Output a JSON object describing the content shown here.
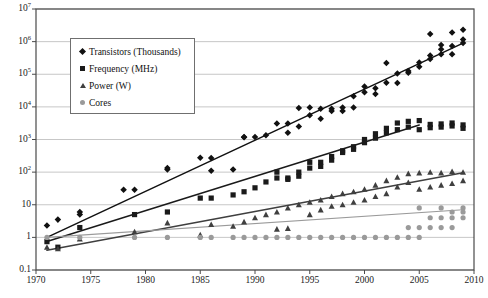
{
  "figure": {
    "caption_visible": "",
    "background": "#ffffff",
    "axis_color": "#4a4a4a",
    "grid_color": "#b9b9b9"
  },
  "legend": {
    "position": "upper-left-inside",
    "entries": [
      {
        "label": "Transistors (Thousands)",
        "marker": "diamond",
        "color": "#111111"
      },
      {
        "label": "Frequency (MHz)",
        "marker": "square",
        "color": "#1a1a1a"
      },
      {
        "label": "Power (W)",
        "marker": "triangle",
        "color": "#3f3f3f"
      },
      {
        "label": "Cores",
        "marker": "circle",
        "color": "#9a9a9a"
      }
    ]
  },
  "chart_data": {
    "type": "scatter",
    "title": "",
    "subtitle": "",
    "xlabel": "",
    "ylabel": "",
    "xlim": [
      1970,
      2010
    ],
    "ylim": [
      0.1,
      10000000
    ],
    "yscale": "log",
    "xscale": "linear",
    "grid": true,
    "xticks": [
      1970,
      1975,
      1980,
      1985,
      1990,
      1995,
      2000,
      2005,
      2010
    ],
    "xticklabels": [
      "1970",
      "1975",
      "1980",
      "1985",
      "1990",
      "1995",
      "2000",
      "2005",
      "2010"
    ],
    "yticks": [
      0.1,
      1,
      10,
      100,
      1000,
      10000,
      100000,
      1000000,
      10000000
    ],
    "yticklabels": [
      "0.1",
      "1",
      "10",
      "10^2",
      "10^3",
      "10^4",
      "10^5",
      "10^6",
      "10^7"
    ],
    "series": [
      {
        "name": "Transistors (Thousands)",
        "marker": "diamond",
        "color": "#111111",
        "trendline": {
          "from": [
            1971,
            1.0
          ],
          "to": [
            2009,
            900000
          ]
        },
        "points": [
          [
            1971,
            2.3
          ],
          [
            1972,
            3.5
          ],
          [
            1974,
            6.0
          ],
          [
            1974,
            5.0
          ],
          [
            1978,
            29
          ],
          [
            1979,
            29
          ],
          [
            1982,
            134
          ],
          [
            1982,
            120
          ],
          [
            1985,
            275
          ],
          [
            1986,
            273
          ],
          [
            1986,
            110
          ],
          [
            1988,
            120
          ],
          [
            1989,
            1180
          ],
          [
            1989,
            1200
          ],
          [
            1990,
            1200
          ],
          [
            1991,
            1350
          ],
          [
            1992,
            3100
          ],
          [
            1993,
            3100
          ],
          [
            1993,
            1600
          ],
          [
            1994,
            2500
          ],
          [
            1994,
            9300
          ],
          [
            1995,
            5500
          ],
          [
            1995,
            9500
          ],
          [
            1996,
            4300
          ],
          [
            1996,
            8800
          ],
          [
            1997,
            7500
          ],
          [
            1997,
            8800
          ],
          [
            1998,
            7500
          ],
          [
            1998,
            9500
          ],
          [
            1999,
            9500
          ],
          [
            1999,
            21000
          ],
          [
            2000,
            28000
          ],
          [
            2000,
            42000
          ],
          [
            2001,
            37000
          ],
          [
            2001,
            25000
          ],
          [
            2002,
            55000
          ],
          [
            2002,
            220000
          ],
          [
            2003,
            54000
          ],
          [
            2003,
            105000
          ],
          [
            2004,
            125000
          ],
          [
            2004,
            112000
          ],
          [
            2005,
            228000
          ],
          [
            2005,
            169000
          ],
          [
            2006,
            291000
          ],
          [
            2006,
            376000
          ],
          [
            2006,
            1700000
          ],
          [
            2007,
            582000
          ],
          [
            2007,
            789000
          ],
          [
            2007,
            410000
          ],
          [
            2008,
            731000
          ],
          [
            2008,
            410000
          ],
          [
            2008,
            1900000
          ],
          [
            2009,
            904000
          ],
          [
            2009,
            2300000
          ],
          [
            2009,
            1170000
          ]
        ]
      },
      {
        "name": "Frequency (MHz)",
        "marker": "square",
        "color": "#1a1a1a",
        "trendline": {
          "from": [
            1971,
            0.75
          ],
          "to": [
            2005,
            2800
          ]
        },
        "points": [
          [
            1971,
            0.74
          ],
          [
            1972,
            0.5
          ],
          [
            1974,
            2.0
          ],
          [
            1979,
            5.0
          ],
          [
            1982,
            6.0
          ],
          [
            1985,
            16
          ],
          [
            1986,
            16
          ],
          [
            1988,
            20
          ],
          [
            1989,
            25
          ],
          [
            1990,
            33
          ],
          [
            1991,
            50
          ],
          [
            1992,
            66
          ],
          [
            1992,
            100
          ],
          [
            1993,
            60
          ],
          [
            1993,
            66
          ],
          [
            1994,
            100
          ],
          [
            1994,
            75
          ],
          [
            1995,
            133
          ],
          [
            1995,
            200
          ],
          [
            1996,
            200
          ],
          [
            1996,
            150
          ],
          [
            1997,
            300
          ],
          [
            1997,
            233
          ],
          [
            1998,
            450
          ],
          [
            1998,
            400
          ],
          [
            1999,
            600
          ],
          [
            1999,
            500
          ],
          [
            2000,
            1000
          ],
          [
            2000,
            800
          ],
          [
            2001,
            1500
          ],
          [
            2001,
            1100
          ],
          [
            2002,
            2200
          ],
          [
            2002,
            1600
          ],
          [
            2003,
            3200
          ],
          [
            2003,
            2000
          ],
          [
            2004,
            3600
          ],
          [
            2004,
            2400
          ],
          [
            2005,
            3800
          ],
          [
            2005,
            2000
          ],
          [
            2006,
            2900
          ],
          [
            2006,
            2300
          ],
          [
            2007,
            3000
          ],
          [
            2007,
            2400
          ],
          [
            2008,
            3200
          ],
          [
            2008,
            2600
          ],
          [
            2009,
            2800
          ],
          [
            2009,
            2200
          ]
        ]
      },
      {
        "name": "Power (W)",
        "marker": "triangle",
        "color": "#3f3f3f",
        "trendline": {
          "from": [
            1971,
            0.4
          ],
          "to": [
            2009,
            95
          ]
        },
        "points": [
          [
            1971,
            0.5
          ],
          [
            1972,
            0.45
          ],
          [
            1974,
            0.9
          ],
          [
            1979,
            1.5
          ],
          [
            1982,
            2.8
          ],
          [
            1985,
            1.2
          ],
          [
            1986,
            2.5
          ],
          [
            1988,
            2.2
          ],
          [
            1989,
            3.0
          ],
          [
            1990,
            4.0
          ],
          [
            1991,
            5.0
          ],
          [
            1992,
            1.8
          ],
          [
            1992,
            6.0
          ],
          [
            1993,
            1.9
          ],
          [
            1993,
            8.0
          ],
          [
            1994,
            10
          ],
          [
            1995,
            12
          ],
          [
            1995,
            5.0
          ],
          [
            1996,
            14
          ],
          [
            1996,
            7.0
          ],
          [
            1997,
            18
          ],
          [
            1997,
            9.0
          ],
          [
            1998,
            22
          ],
          [
            1998,
            10
          ],
          [
            1999,
            25
          ],
          [
            1999,
            12
          ],
          [
            2000,
            30
          ],
          [
            2000,
            14
          ],
          [
            2001,
            40
          ],
          [
            2001,
            18
          ],
          [
            2002,
            55
          ],
          [
            2002,
            22
          ],
          [
            2003,
            70
          ],
          [
            2003,
            35
          ],
          [
            2004,
            90
          ],
          [
            2004,
            48
          ],
          [
            2005,
            95
          ],
          [
            2005,
            30
          ],
          [
            2006,
            100
          ],
          [
            2006,
            35
          ],
          [
            2007,
            95
          ],
          [
            2007,
            40
          ],
          [
            2008,
            105
          ],
          [
            2008,
            45
          ],
          [
            2009,
            100
          ],
          [
            2009,
            55
          ]
        ]
      },
      {
        "name": "Cores",
        "marker": "circle",
        "color": "#9a9a9a",
        "trendline": {
          "from": [
            1971,
            1
          ],
          "to": [
            2009,
            7
          ]
        },
        "points": [
          [
            1971,
            1
          ],
          [
            1974,
            1
          ],
          [
            1979,
            1
          ],
          [
            1982,
            1
          ],
          [
            1985,
            1
          ],
          [
            1986,
            1
          ],
          [
            1988,
            1
          ],
          [
            1989,
            1
          ],
          [
            1990,
            1
          ],
          [
            1991,
            1
          ],
          [
            1992,
            1
          ],
          [
            1993,
            1
          ],
          [
            1994,
            1
          ],
          [
            1995,
            1
          ],
          [
            1996,
            1
          ],
          [
            1997,
            1
          ],
          [
            1998,
            1
          ],
          [
            1999,
            1
          ],
          [
            2000,
            1
          ],
          [
            2001,
            1
          ],
          [
            2002,
            1
          ],
          [
            2003,
            1
          ],
          [
            2004,
            2
          ],
          [
            2004,
            1
          ],
          [
            2005,
            2
          ],
          [
            2005,
            1
          ],
          [
            2005,
            8
          ],
          [
            2006,
            2
          ],
          [
            2006,
            4
          ],
          [
            2007,
            4
          ],
          [
            2007,
            2
          ],
          [
            2007,
            8
          ],
          [
            2008,
            4
          ],
          [
            2008,
            2
          ],
          [
            2008,
            6
          ],
          [
            2009,
            6
          ],
          [
            2009,
            4
          ],
          [
            2009,
            8
          ]
        ]
      }
    ]
  }
}
